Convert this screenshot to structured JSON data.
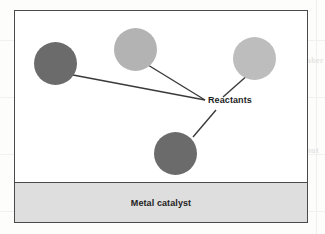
{
  "figure": {
    "type": "diagram",
    "labels": {
      "reactants": "Reactants",
      "catalyst": "Metal catalyst"
    },
    "colors": {
      "frame_border": "#4a4a4a",
      "figure_background": "#ffffff",
      "catalyst_fill": "#dedede",
      "catalyst_border": "#4a4a4a",
      "particle_dark": "#6b6b6b",
      "particle_light": "#b3b3b3",
      "particle_lightest": "#bdbdbd",
      "leader_line": "#3a3a3a",
      "label_text": "#1d1d1d",
      "page_background": "#fdfdfc",
      "bleed_text": "#e6e4e2"
    },
    "particles": [
      {
        "id": "particle-upper-left",
        "shade": "dark",
        "fill": "#6b6b6b",
        "cx": 40,
        "cy": 52,
        "r": 21.5
      },
      {
        "id": "particle-top-middle",
        "shade": "light",
        "fill": "#b3b3b3",
        "cx": 120,
        "cy": 38,
        "r": 21.5
      },
      {
        "id": "particle-upper-right",
        "shade": "lightest",
        "fill": "#bdbdbd",
        "cx": 239,
        "cy": 47,
        "r": 21.5
      },
      {
        "id": "particle-lower-middle",
        "shade": "dark",
        "fill": "#6b6b6b",
        "cx": 160,
        "cy": 142,
        "r": 21.5
      }
    ],
    "leader_lines": [
      {
        "id": "leader-from-upper-left",
        "x1": 58,
        "y1": 64,
        "x2": 190,
        "y2": 89
      },
      {
        "id": "leader-from-top-middle",
        "x1": 133,
        "y1": 54,
        "x2": 190,
        "y2": 89
      },
      {
        "id": "leader-from-upper-right",
        "x1": 234,
        "y1": 63,
        "x2": 208,
        "y2": 86
      },
      {
        "id": "leader-from-lower-middle",
        "x1": 178,
        "y1": 126,
        "x2": 201,
        "y2": 99
      }
    ],
    "callout": {
      "text": "Reactants",
      "left": 193,
      "top": 84
    },
    "catalyst_band": {
      "text": "Metal catalyst",
      "height": 39
    }
  },
  "page_artifacts": {
    "bleed_upper": "k number",
    "bleed_lower": "mmo T qmut"
  }
}
